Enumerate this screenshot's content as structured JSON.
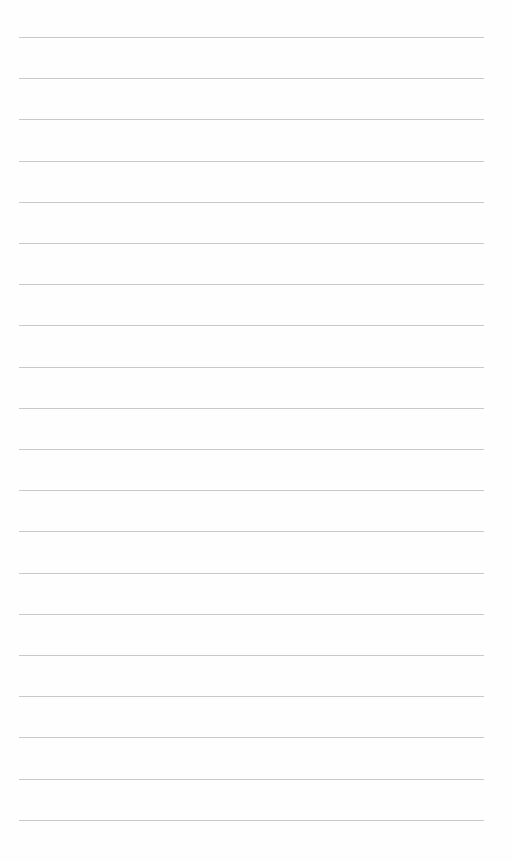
{
  "paper": {
    "type": "lined-paper",
    "line_count": 20,
    "first_line_y": 37,
    "line_spacing": 41.2,
    "line_left": 19,
    "line_width": 465,
    "line_color": "#c9c9c9",
    "background_color": "#fefefe"
  }
}
